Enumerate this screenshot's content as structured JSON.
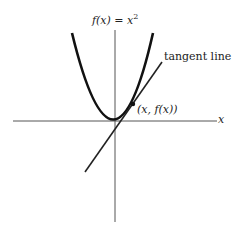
{
  "diagram": {
    "function_label": "f(x) = x",
    "function_label_exponent": "2",
    "tangent_label": "tangent line",
    "point_label": "(x, f(x))",
    "x_axis_label": "x",
    "colors": {
      "curve": "#111111",
      "axis": "#555555",
      "tangent": "#222222",
      "text": "#222222"
    }
  }
}
